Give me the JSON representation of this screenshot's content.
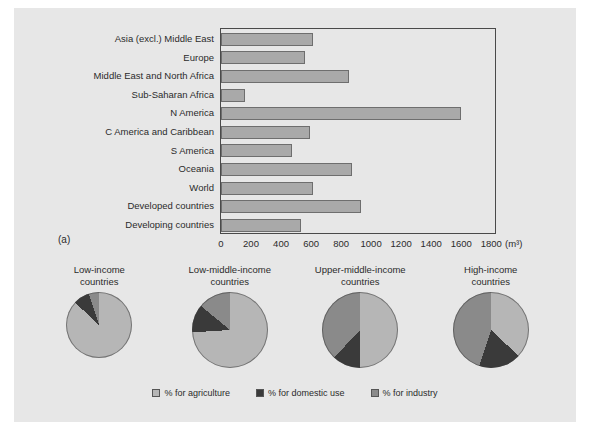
{
  "figure": {
    "panel_a_label": "(a)",
    "panel_b_label": "(b)"
  },
  "chart_data": [
    {
      "type": "bar",
      "orientation": "horizontal",
      "title": "",
      "xlabel": "(m³)",
      "ylabel": "",
      "xlim": [
        0,
        1800
      ],
      "xticks": [
        0,
        200,
        400,
        600,
        800,
        1000,
        1200,
        1400,
        1600,
        1800
      ],
      "unit_label": "(m³)",
      "grid": false,
      "categories": [
        "Asia (excl.) Middle East",
        "Europe",
        "Middle East and North Africa",
        "Sub-Saharan Africa",
        "N America",
        "C America and Caribbean",
        "S America",
        "Oceania",
        "World",
        "Developed countries",
        "Developing countries"
      ],
      "values": [
        615,
        560,
        850,
        160,
        1600,
        590,
        470,
        870,
        615,
        930,
        535
      ],
      "bar_color": "#a9a9a9",
      "bar_border": "#6e6e6e"
    },
    {
      "type": "pie",
      "title": "",
      "legend_position": "bottom",
      "legend": [
        "% for agriculture",
        "% for domestic use",
        "% for industry"
      ],
      "slice_colors": [
        "#b6b6b6",
        "#3a3a3a",
        "#8a8a8a"
      ],
      "pies": [
        {
          "title_line1": "Low-income",
          "title_line2": "countries",
          "size": "small",
          "labels": [
            "% for agriculture",
            "% for domestic use",
            "% for industry"
          ],
          "values": [
            87,
            8,
            5
          ]
        },
        {
          "title_line1": "Low-middle-income",
          "title_line2": "countries",
          "size": "large",
          "labels": [
            "% for agriculture",
            "% for domestic use",
            "% for industry"
          ],
          "values": [
            74,
            12,
            14
          ]
        },
        {
          "title_line1": "Upper-middle-income",
          "title_line2": "countries",
          "size": "large",
          "labels": [
            "% for agriculture",
            "% for domestic use",
            "% for industry"
          ],
          "values": [
            50,
            12,
            38
          ]
        },
        {
          "title_line1": "High-income",
          "title_line2": "countries",
          "size": "large",
          "labels": [
            "% for agriculture",
            "% for domestic use",
            "% for industry"
          ],
          "values": [
            37,
            18,
            45
          ]
        }
      ]
    }
  ]
}
